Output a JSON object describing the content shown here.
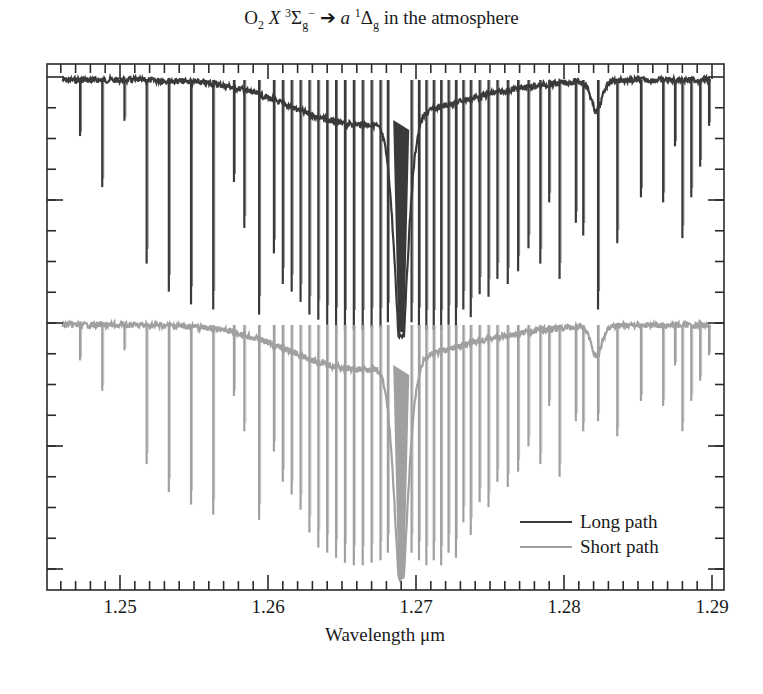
{
  "title": {
    "molecule": "O",
    "molecule_sub": "2",
    "state1": "X",
    "state1_sup": "3",
    "state1_sym": "Σ",
    "state1_sub": "g",
    "state1_sup2": "−",
    "arrow": "➔",
    "state2": "a",
    "state2_sup": "1",
    "state2_sym": "Δ",
    "state2_sub": "g",
    "suffix": "in the atmosphere"
  },
  "chart_data": {
    "type": "line",
    "xlabel": "Wavelength μm",
    "ylabel": "",
    "xlim": [
      1.2455,
      1.2907
    ],
    "x_ticks": [
      "1.25",
      "1.26",
      "1.27",
      "1.28",
      "1.29"
    ],
    "x_tick_values": [
      1.25,
      1.26,
      1.27,
      1.28,
      1.29
    ],
    "x_minor_step": 0.001,
    "y_ticks_labeled": false,
    "y_major_ticks": 5,
    "y_minor_per_major": 4,
    "grid": false,
    "legend_position": "lower right",
    "legend": [
      {
        "label": "Long path",
        "color": "#3a3a3a"
      },
      {
        "label": "Short path",
        "color": "#a0a0a0"
      }
    ],
    "series": [
      {
        "name": "Long path",
        "color": "#3a3a3a",
        "baseline_y_px": 80,
        "floor_y_px": 335,
        "band_center_um": 1.269,
        "band_floor_y_px": 332,
        "lines": [
          [
            1.2473,
            0.22
          ],
          [
            1.2488,
            0.42
          ],
          [
            1.2503,
            0.16
          ],
          [
            1.2518,
            0.72
          ],
          [
            1.2533,
            0.83
          ],
          [
            1.2548,
            0.88
          ],
          [
            1.2563,
            0.9
          ],
          [
            1.2577,
            0.4
          ],
          [
            1.2584,
            0.58
          ],
          [
            1.2594,
            0.92
          ],
          [
            1.2604,
            0.68
          ],
          [
            1.261,
            0.8
          ],
          [
            1.2616,
            0.83
          ],
          [
            1.2622,
            0.87
          ],
          [
            1.2628,
            0.92
          ],
          [
            1.2634,
            0.94
          ],
          [
            1.264,
            0.96
          ],
          [
            1.2646,
            0.97
          ],
          [
            1.2652,
            0.98
          ],
          [
            1.2658,
            0.98
          ],
          [
            1.2664,
            0.98
          ],
          [
            1.267,
            0.97
          ],
          [
            1.2676,
            0.97
          ],
          [
            1.2681,
            0.95
          ],
          [
            1.2697,
            0.95
          ],
          [
            1.2702,
            0.97
          ],
          [
            1.2707,
            0.98
          ],
          [
            1.2712,
            0.98
          ],
          [
            1.2717,
            0.98
          ],
          [
            1.2722,
            0.96
          ],
          [
            1.2727,
            0.97
          ],
          [
            1.2732,
            0.9
          ],
          [
            1.2737,
            0.93
          ],
          [
            1.2743,
            0.84
          ],
          [
            1.2749,
            0.85
          ],
          [
            1.2755,
            0.78
          ],
          [
            1.2762,
            0.8
          ],
          [
            1.2769,
            0.75
          ],
          [
            1.2776,
            0.66
          ],
          [
            1.2784,
            0.72
          ],
          [
            1.279,
            0.48
          ],
          [
            1.2797,
            0.78
          ],
          [
            1.2808,
            0.56
          ],
          [
            1.2813,
            0.61
          ],
          [
            1.2823,
            0.9
          ],
          [
            1.2836,
            0.64
          ],
          [
            1.2852,
            0.46
          ],
          [
            1.2867,
            0.48
          ],
          [
            1.2875,
            0.26
          ],
          [
            1.288,
            0.62
          ],
          [
            1.2886,
            0.46
          ],
          [
            1.2892,
            0.34
          ],
          [
            1.2898,
            0.18
          ]
        ]
      },
      {
        "name": "Short path",
        "color": "#a0a0a0",
        "baseline_y_px": 325,
        "floor_y_px": 578,
        "band_center_um": 1.269,
        "band_floor_y_px": 578,
        "lines": [
          [
            1.2473,
            0.14
          ],
          [
            1.2488,
            0.26
          ],
          [
            1.2503,
            0.1
          ],
          [
            1.2518,
            0.55
          ],
          [
            1.2533,
            0.66
          ],
          [
            1.2548,
            0.71
          ],
          [
            1.2563,
            0.75
          ],
          [
            1.2577,
            0.28
          ],
          [
            1.2584,
            0.42
          ],
          [
            1.2594,
            0.77
          ],
          [
            1.2604,
            0.5
          ],
          [
            1.261,
            0.62
          ],
          [
            1.2616,
            0.67
          ],
          [
            1.2622,
            0.73
          ],
          [
            1.2628,
            0.82
          ],
          [
            1.2634,
            0.88
          ],
          [
            1.264,
            0.9
          ],
          [
            1.2646,
            0.92
          ],
          [
            1.2652,
            0.94
          ],
          [
            1.2658,
            0.95
          ],
          [
            1.2664,
            0.95
          ],
          [
            1.267,
            0.94
          ],
          [
            1.2676,
            0.93
          ],
          [
            1.2681,
            0.9
          ],
          [
            1.2697,
            0.9
          ],
          [
            1.2702,
            0.93
          ],
          [
            1.2707,
            0.95
          ],
          [
            1.2712,
            0.93
          ],
          [
            1.2717,
            0.95
          ],
          [
            1.2722,
            0.9
          ],
          [
            1.2727,
            0.92
          ],
          [
            1.2732,
            0.78
          ],
          [
            1.2737,
            0.83
          ],
          [
            1.2743,
            0.7
          ],
          [
            1.2749,
            0.72
          ],
          [
            1.2755,
            0.62
          ],
          [
            1.2762,
            0.64
          ],
          [
            1.2769,
            0.58
          ],
          [
            1.2776,
            0.48
          ],
          [
            1.2784,
            0.55
          ],
          [
            1.279,
            0.32
          ],
          [
            1.2797,
            0.6
          ],
          [
            1.2808,
            0.38
          ],
          [
            1.2813,
            0.42
          ],
          [
            1.2823,
            0.38
          ],
          [
            1.2836,
            0.44
          ],
          [
            1.2852,
            0.3
          ],
          [
            1.2867,
            0.32
          ],
          [
            1.2875,
            0.16
          ],
          [
            1.288,
            0.42
          ],
          [
            1.2886,
            0.3
          ],
          [
            1.2892,
            0.22
          ],
          [
            1.2898,
            0.12
          ]
        ]
      }
    ]
  },
  "axis": {
    "x_tick_labels": [
      "1.25",
      "1.26",
      "1.27",
      "1.28",
      "1.29"
    ],
    "xlabel": "Wavelength μm"
  },
  "legend": {
    "items": [
      {
        "label": "Long path",
        "color": "#3a3a3a"
      },
      {
        "label": "Short path",
        "color": "#a0a0a0"
      }
    ]
  },
  "frame": {
    "left": 47,
    "right": 724,
    "top": 64,
    "bottom": 590
  }
}
